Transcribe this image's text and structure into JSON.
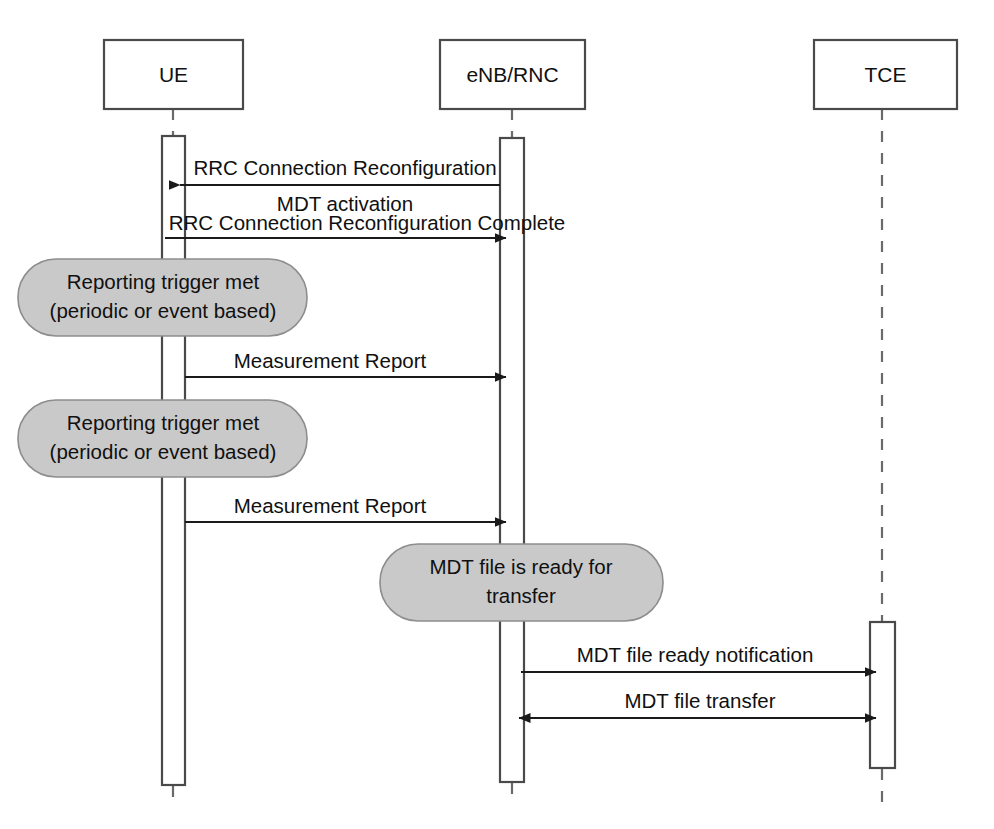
{
  "diagram": {
    "type": "uml-sequence-diagram",
    "colors": {
      "note_fill": "#c9c9c9",
      "note_stroke": "#8d8d8d",
      "box_stroke": "#4a4a4a",
      "line": "#1a1a1a",
      "background": "#ffffff"
    },
    "participants": [
      {
        "id": "ue",
        "label": "UE",
        "x": 173,
        "box_x": 104,
        "box_y": 40,
        "box_w": 139,
        "box_h": 69,
        "bar_x": 162,
        "bar_y": 136,
        "bar_w": 23,
        "bar_h": 649
      },
      {
        "id": "enb",
        "label": "eNB/RNC",
        "x": 512,
        "box_x": 440,
        "box_y": 40,
        "box_w": 145,
        "box_h": 69,
        "bar_x": 500,
        "bar_y": 138,
        "bar_w": 24,
        "bar_h": 644
      },
      {
        "id": "tce",
        "label": "TCE",
        "x": 882,
        "box_x": 814,
        "box_y": 40,
        "box_w": 143,
        "box_h": 69,
        "bar_x": 870,
        "bar_y": 622,
        "bar_w": 25,
        "bar_h": 146
      }
    ],
    "messages": [
      {
        "id": "m1",
        "label": "RRC Connection Reconfiguration",
        "sublabel": "MDT activation",
        "from": "enb",
        "to": "ue",
        "direction": "right-to-left",
        "y": 185,
        "label_y": 175,
        "sublabel_y": 204,
        "arrowheads": "left"
      },
      {
        "id": "m2",
        "label": "RRC Connection Reconfiguration Complete",
        "from": "ue",
        "to": "enb",
        "direction": "left-to-right",
        "y": 235,
        "label_y": 227,
        "arrowheads": "right"
      },
      {
        "id": "m3",
        "label": "Measurement Report",
        "from": "ue",
        "to": "enb",
        "direction": "left-to-right",
        "y": 375,
        "label_y": 366,
        "arrowheads": "right"
      },
      {
        "id": "m4",
        "label": "Measurement Report",
        "from": "ue",
        "to": "enb",
        "direction": "left-to-right",
        "y": 520,
        "label_y": 511,
        "arrowheads": "right"
      },
      {
        "id": "m5",
        "label": "MDT file ready notification",
        "from": "enb",
        "to": "tce",
        "direction": "left-to-right",
        "y": 670,
        "label_y": 660,
        "arrowheads": "right"
      },
      {
        "id": "m6",
        "label": "MDT file transfer",
        "from": "enb",
        "to": "tce",
        "direction": "bidirectional",
        "y": 716,
        "label_y": 706,
        "arrowheads": "both"
      }
    ],
    "notes": [
      {
        "id": "note1",
        "line1": "Reporting trigger met",
        "line2": "(periodic or event based)",
        "x": 18,
        "y": 259,
        "w": 289,
        "h": 77,
        "rx": 38
      },
      {
        "id": "note2",
        "line1": "Reporting trigger met",
        "line2": "(periodic or event based)",
        "x": 18,
        "y": 400,
        "w": 289,
        "h": 77,
        "rx": 38
      },
      {
        "id": "note3",
        "line1": "MDT file is ready for",
        "line2": "transfer",
        "x": 380,
        "y": 544,
        "w": 283,
        "h": 77,
        "rx": 38
      }
    ]
  }
}
